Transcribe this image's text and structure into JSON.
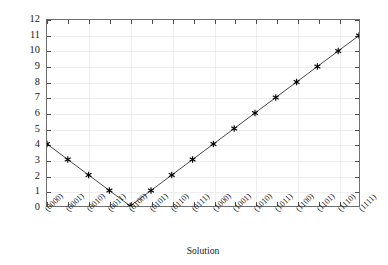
{
  "chart_data": {
    "type": "line",
    "title": "",
    "subtitle": "",
    "xlabel": "Solution",
    "ylabel": "Objective Value",
    "categories": [
      "(0000)",
      "(0001)",
      "(0010)",
      "(0011)",
      "(0100)",
      "(0101)",
      "(0110)",
      "(0111)",
      "(1000)",
      "(1001)",
      "(1010)",
      "(1011)",
      "(1100)",
      "(1101)",
      "(1110)",
      "(1111)"
    ],
    "values": [
      4,
      3,
      2,
      1,
      0,
      1,
      2,
      3,
      4,
      5,
      6,
      7,
      8,
      9,
      10,
      11
    ],
    "ylim": [
      0,
      12
    ],
    "ytick_labels": [
      "0",
      "1",
      "2",
      "3",
      "4",
      "5",
      "6",
      "7",
      "8",
      "9",
      "10",
      "11",
      "12"
    ],
    "ytick_values": [
      0,
      1,
      2,
      3,
      4,
      5,
      6,
      7,
      8,
      9,
      10,
      11,
      12
    ],
    "grid": true,
    "legend": null,
    "legend_position": "none",
    "marker": "asterisk-marker",
    "line_color": "#333333",
    "marker_color": "#000000",
    "grid_color": "#eeeeee",
    "axis_color": "#6e6e6e",
    "background_color": "#ffffff"
  }
}
